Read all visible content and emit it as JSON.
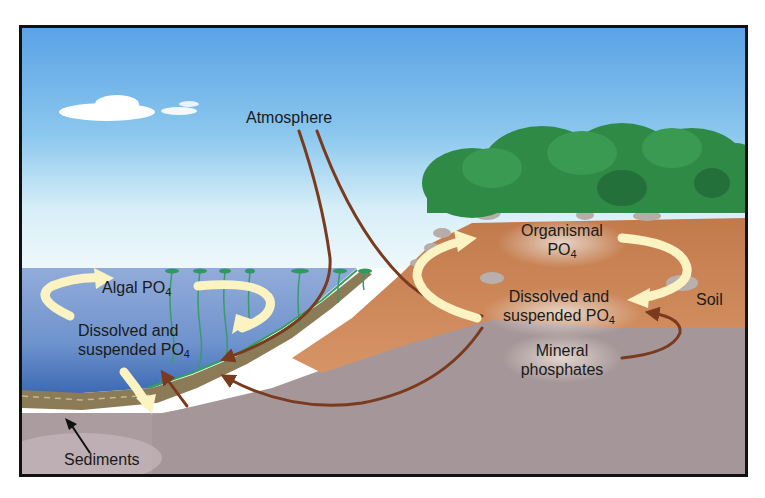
{
  "diagram": {
    "labels": {
      "atmosphere": "Atmosphere",
      "algal": {
        "text": "Algal PO",
        "sub": "4"
      },
      "water_dissolved_line1": "Dissolved and",
      "water_dissolved_line2": {
        "text": "suspended PO",
        "sub": "4"
      },
      "sediments": "Sediments",
      "organismal_line1": "Organismal",
      "organismal_line2": {
        "text": "PO",
        "sub": "4"
      },
      "soil_dissolved_line1": "Dissolved and",
      "soil_dissolved_line2": {
        "text": "suspended PO",
        "sub": "4"
      },
      "soil": "Soil",
      "mineral_line1": "Mineral",
      "mineral_line2": "phosphates"
    },
    "colors": {
      "sky_top": "#5aa3e6",
      "sky_bottom": "#e8f6fb",
      "water": "#6f95cf",
      "water_deep": "#3f6fb8",
      "soil": "#c98556",
      "bedrock": "#a7999c",
      "sediment": "#8a7a55",
      "shrub": "#2f8a45",
      "cycle_arrow": "#fbf3c2",
      "flow_arrow": "#7a3a1e",
      "frame": "#111111"
    }
  }
}
